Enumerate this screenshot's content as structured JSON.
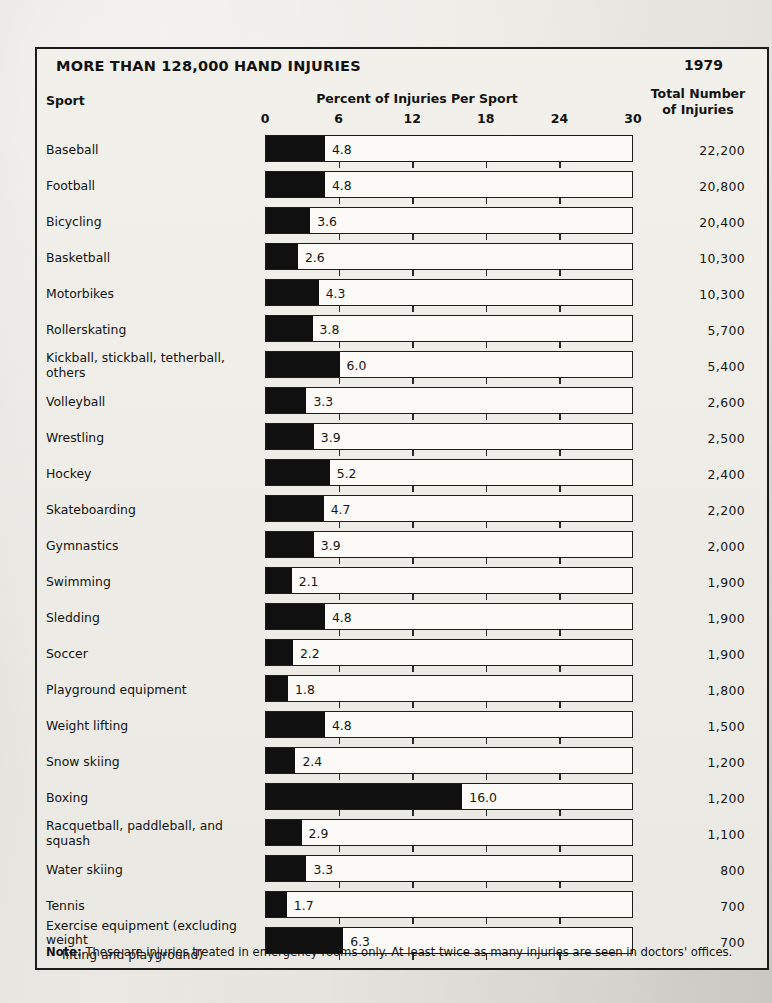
{
  "header": {
    "title": "MORE THAN 128,000 HAND INJURIES",
    "year": "1979",
    "sport_column": "Sport",
    "total_column_line1": "Total Number",
    "total_column_line2": "of Injuries"
  },
  "footnote": {
    "label": "Note:",
    "text": " These are injuries treated in emergency rooms only.  At least twice as many injuries are seen in doctors' offices."
  },
  "chart_data": {
    "type": "bar",
    "title": "MORE THAN 128,000 HAND INJURIES",
    "subtitle": "1979",
    "xlabel": "Percent of Injuries Per Sport",
    "ylabel": "Sport",
    "xlim": [
      0,
      30
    ],
    "xticks": [
      0,
      6,
      12,
      18,
      24,
      30
    ],
    "xtick_labels": [
      "0",
      "6",
      "12",
      "18",
      "24",
      "30"
    ],
    "grid": false,
    "orientation": "horizontal",
    "legend": "none",
    "value_column_header": "Total Number of Injuries",
    "categories": [
      "Baseball",
      "Football",
      "Bicycling",
      "Basketball",
      "Motorbikes",
      "Rollerskating",
      "Kickball, stickball, tetherball, others",
      "Volleyball",
      "Wrestling",
      "Hockey",
      "Skateboarding",
      "Gymnastics",
      "Swimming",
      "Sledding",
      "Soccer",
      "Playground equipment",
      "Weight lifting",
      "Snow skiing",
      "Boxing",
      "Racquetball, paddleball, and squash",
      "Water skiing",
      "Tennis",
      "Exercise equipment (excluding weight lifting and playground)"
    ],
    "values": [
      4.8,
      4.8,
      3.6,
      2.6,
      4.3,
      3.8,
      6.0,
      3.3,
      3.9,
      5.2,
      4.7,
      3.9,
      2.1,
      4.8,
      2.2,
      1.8,
      4.8,
      2.4,
      16.0,
      2.9,
      3.3,
      1.7,
      6.3
    ],
    "value_labels": [
      "4.8",
      "4.8",
      "3.6",
      "2.6",
      "4.3",
      "3.8",
      "6.0",
      "3.3",
      "3.9",
      "5.2",
      "4.7",
      "3.9",
      "2.1",
      "4.8",
      "2.2",
      "1.8",
      "4.8",
      "2.4",
      "16.0",
      "2.9",
      "3.3",
      "1.7",
      "6.3"
    ],
    "totals": [
      22200,
      20800,
      20400,
      10300,
      10300,
      5700,
      5400,
      2600,
      2500,
      2400,
      2200,
      2000,
      1900,
      1900,
      1900,
      1800,
      1500,
      1200,
      1200,
      1100,
      800,
      700,
      700
    ],
    "total_labels": [
      "22,200",
      "20,800",
      "20,400",
      "10,300",
      "10,300",
      "5,700",
      "5,400",
      "2,600",
      "2,500",
      "2,400",
      "2,200",
      "2,000",
      "1,900",
      "1,900",
      "1,900",
      "1,800",
      "1,500",
      "1,200",
      "1,200",
      "1,100",
      "800",
      "700",
      "700"
    ]
  },
  "rows": [
    {
      "label": "Baseball",
      "label2": "",
      "value": "4.8",
      "total": "22,200"
    },
    {
      "label": "Football",
      "label2": "",
      "value": "4.8",
      "total": "20,800"
    },
    {
      "label": "Bicycling",
      "label2": "",
      "value": "3.6",
      "total": "20,400"
    },
    {
      "label": "Basketball",
      "label2": "",
      "value": "2.6",
      "total": "10,300"
    },
    {
      "label": "Motorbikes",
      "label2": "",
      "value": "4.3",
      "total": "10,300"
    },
    {
      "label": "Rollerskating",
      "label2": "",
      "value": "3.8",
      "total": "5,700"
    },
    {
      "label": "Kickball, stickball, tetherball, others",
      "label2": "",
      "value": "6.0",
      "total": "5,400"
    },
    {
      "label": "Volleyball",
      "label2": "",
      "value": "3.3",
      "total": "2,600"
    },
    {
      "label": "Wrestling",
      "label2": "",
      "value": "3.9",
      "total": "2,500"
    },
    {
      "label": "Hockey",
      "label2": "",
      "value": "5.2",
      "total": "2,400"
    },
    {
      "label": "Skateboarding",
      "label2": "",
      "value": "4.7",
      "total": "2,200"
    },
    {
      "label": "Gymnastics",
      "label2": "",
      "value": "3.9",
      "total": "2,000"
    },
    {
      "label": "Swimming",
      "label2": "",
      "value": "2.1",
      "total": "1,900"
    },
    {
      "label": "Sledding",
      "label2": "",
      "value": "4.8",
      "total": "1,900"
    },
    {
      "label": "Soccer",
      "label2": "",
      "value": "2.2",
      "total": "1,900"
    },
    {
      "label": "Playground equipment",
      "label2": "",
      "value": "1.8",
      "total": "1,800"
    },
    {
      "label": "Weight lifting",
      "label2": "",
      "value": "4.8",
      "total": "1,500"
    },
    {
      "label": "Snow skiing",
      "label2": "",
      "value": "2.4",
      "total": "1,200"
    },
    {
      "label": "Boxing",
      "label2": "",
      "value": "16.0",
      "total": "1,200"
    },
    {
      "label": "Racquetball, paddleball, and squash",
      "label2": "",
      "value": "2.9",
      "total": "1,100"
    },
    {
      "label": "Water skiing",
      "label2": "",
      "value": "3.3",
      "total": "800"
    },
    {
      "label": "Tennis",
      "label2": "",
      "value": "1.7",
      "total": "700"
    },
    {
      "label": "Exercise equipment (excluding weight",
      "label2": "lifting and playground)",
      "value": "6.3",
      "total": "700"
    }
  ]
}
